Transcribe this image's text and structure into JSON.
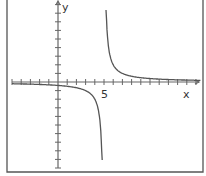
{
  "chart_data": {
    "type": "line",
    "title": "",
    "xlabel": "x",
    "ylabel": "y",
    "x_tick_label": "5",
    "x_tick_label_value": 5,
    "xlim": [
      -5,
      15
    ],
    "ylim": [
      -10,
      10
    ],
    "grid": false,
    "legend": null,
    "vertical_asymptote": 5,
    "horizontal_asymptote": 0,
    "function_description": "rational function approx y = 2/(x-5), hyperbola with vertical asymptote at x=5",
    "series": [
      {
        "name": "left branch",
        "x": [
          -5,
          -3,
          -1,
          0,
          1,
          2,
          3,
          4,
          4.5,
          4.8
        ],
        "y": [
          -0.2,
          -0.25,
          -0.33,
          -0.4,
          -0.5,
          -0.67,
          -1,
          -2,
          -4,
          -10
        ]
      },
      {
        "name": "right branch",
        "x": [
          5.2,
          5.5,
          6,
          7,
          8,
          10,
          12,
          15
        ],
        "y": [
          10,
          4,
          2,
          1,
          0.67,
          0.4,
          0.29,
          0.2
        ]
      }
    ]
  },
  "labels": {
    "x_axis": "x",
    "y_axis": "y",
    "tick_five": "5"
  },
  "colors": {
    "axis": "#666666",
    "curve": "#555555",
    "background": "#ffffff"
  }
}
